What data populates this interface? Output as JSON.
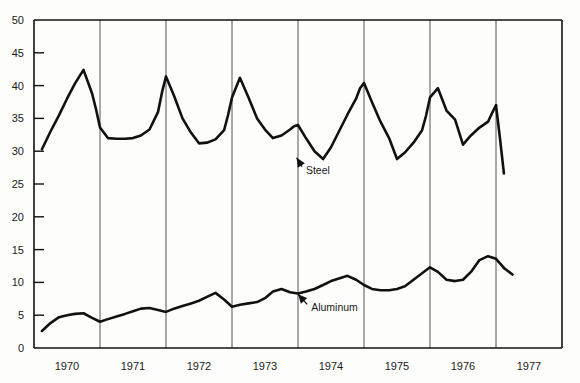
{
  "chart_data": {
    "type": "line",
    "title": "",
    "subtitle": "",
    "xlabel": "",
    "ylabel": "",
    "xlim": [
      1969.5,
      1977.5
    ],
    "ylim": [
      0,
      50
    ],
    "grid": true,
    "grid_orientation": "vertical",
    "legend_position": "inline-annotations",
    "yticks": [
      0,
      5,
      10,
      15,
      20,
      25,
      30,
      35,
      40,
      45,
      50
    ],
    "ytick_labels": [
      "0",
      "5",
      "10",
      "15",
      "20",
      "25",
      "30",
      "35",
      "40",
      "45",
      "50"
    ],
    "xticks": [
      1970,
      1971,
      1972,
      1973,
      1974,
      1975,
      1976,
      1977
    ],
    "xtick_labels": [
      "1970",
      "1971",
      "1972",
      "1973",
      "1974",
      "1975",
      "1976",
      "1977"
    ],
    "x_gridlines": [
      1970.5,
      1971.5,
      1972.5,
      1973.5,
      1974.5,
      1975.5,
      1976.5
    ],
    "annotations": [
      {
        "text": "Steel",
        "x": 1973.62,
        "y": 27.2,
        "arrow_to_x": 1973.48,
        "arrow_to_y": 29.0
      },
      {
        "text": "Aluminum",
        "x": 1973.7,
        "y": 6.2,
        "arrow_to_x": 1973.5,
        "arrow_to_y": 8.2
      }
    ],
    "series": [
      {
        "name": "Steel",
        "color": "#111111",
        "x": [
          1969.62,
          1969.75,
          1969.88,
          1970.0,
          1970.12,
          1970.25,
          1970.38,
          1970.44,
          1970.5,
          1970.62,
          1970.75,
          1970.88,
          1971.0,
          1971.12,
          1971.25,
          1971.38,
          1971.44,
          1971.5,
          1971.62,
          1971.75,
          1971.88,
          1972.0,
          1972.12,
          1972.25,
          1972.38,
          1972.44,
          1972.5,
          1972.62,
          1972.75,
          1972.88,
          1973.0,
          1973.12,
          1973.25,
          1973.38,
          1973.44,
          1973.5,
          1973.62,
          1973.75,
          1973.88,
          1974.0,
          1974.12,
          1974.25,
          1974.38,
          1974.44,
          1974.5,
          1974.62,
          1974.75,
          1974.88,
          1975.0,
          1975.12,
          1975.25,
          1975.38,
          1975.44,
          1975.5,
          1975.62,
          1975.75,
          1975.88,
          1976.0,
          1976.12,
          1976.25,
          1976.38,
          1976.44,
          1976.5
        ],
        "y": [
          30.3,
          33.0,
          35.5,
          38.0,
          40.3,
          42.4,
          38.8,
          36.4,
          33.6,
          32.0,
          31.9,
          31.9,
          32.0,
          32.4,
          33.3,
          36.0,
          39.0,
          41.4,
          38.5,
          35.0,
          32.8,
          31.2,
          31.3,
          31.8,
          33.2,
          35.5,
          38.2,
          41.2,
          38.2,
          35.0,
          33.3,
          32.0,
          32.4,
          33.3,
          33.8,
          34.0,
          32.0,
          30.0,
          28.8,
          30.6,
          33.0,
          35.6,
          38.0,
          39.6,
          40.4,
          37.5,
          34.5,
          32.0,
          28.8,
          29.8,
          31.3,
          33.2,
          35.4,
          38.2,
          39.6,
          36.2,
          34.8,
          31.0,
          32.4,
          33.6,
          34.5,
          35.8,
          37.0
        ]
      },
      {
        "name": "Steel-tail",
        "color": "#111111",
        "x": [
          1976.5,
          1976.56,
          1976.62
        ],
        "y": [
          37.0,
          32.0,
          26.6
        ]
      },
      {
        "name": "Aluminum",
        "color": "#111111",
        "x": [
          1969.62,
          1969.75,
          1969.88,
          1970.0,
          1970.12,
          1970.25,
          1970.38,
          1970.5,
          1970.62,
          1970.75,
          1970.88,
          1971.0,
          1971.12,
          1971.25,
          1971.38,
          1971.5,
          1971.62,
          1971.75,
          1971.88,
          1972.0,
          1972.12,
          1972.25,
          1972.38,
          1972.5,
          1972.62,
          1972.75,
          1972.88,
          1973.0,
          1973.12,
          1973.25,
          1973.38,
          1973.5,
          1973.62,
          1973.75,
          1973.88,
          1974.0,
          1974.12,
          1974.25,
          1974.38,
          1974.5,
          1974.62,
          1974.75,
          1974.88,
          1975.0,
          1975.12,
          1975.25,
          1975.38,
          1975.5,
          1975.62,
          1975.75,
          1975.88,
          1976.0,
          1976.12,
          1976.25,
          1976.38,
          1976.5,
          1976.62
        ],
        "y": [
          2.6,
          3.8,
          4.7,
          5.0,
          5.2,
          5.3,
          4.6,
          4.0,
          4.4,
          4.8,
          5.2,
          5.6,
          6.0,
          6.1,
          5.8,
          5.5,
          6.0,
          6.4,
          6.8,
          7.2,
          7.8,
          8.4,
          7.4,
          6.3,
          6.6,
          6.8,
          7.0,
          7.6,
          8.6,
          9.0,
          8.5,
          8.3,
          8.6,
          9.0,
          9.6,
          10.2,
          10.6,
          11.0,
          10.4,
          9.6,
          9.0,
          8.8,
          8.8,
          9.0,
          9.4,
          10.4,
          11.4,
          12.3,
          11.6,
          10.4,
          10.2,
          10.4,
          11.6,
          13.4,
          14.0,
          13.6,
          12.2
        ]
      },
      {
        "name": "Aluminum-tail",
        "color": "#111111",
        "x": [
          1976.62,
          1976.75
        ],
        "y": [
          12.2,
          11.2
        ]
      }
    ]
  },
  "axes": {
    "frame_color": "#111111",
    "gridline_color": "#555555"
  }
}
